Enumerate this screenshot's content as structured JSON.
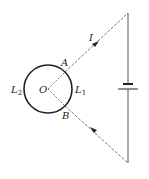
{
  "diagram": {
    "labels": {
      "current": "I",
      "point_a": "A",
      "point_b": "B",
      "center": "O",
      "arc_left": "L",
      "arc_left_sub": "2",
      "arc_right": "L",
      "arc_right_sub": "1"
    },
    "colors": {
      "stroke": "#222222",
      "wire": "#555555",
      "background": "#ffffff"
    },
    "elements": {
      "ring": {
        "cx": 48,
        "cy": 89,
        "r": 24
      },
      "wire_top": {
        "from": [
          48,
          89
        ],
        "to": [
          128,
          13
        ]
      },
      "wire_bottom": {
        "from": [
          48,
          89
        ],
        "to": [
          128,
          163
        ]
      },
      "wire_right": {
        "x": 128,
        "y_top": 13,
        "y_bottom": 163
      },
      "battery": {
        "short_plate_y": 84,
        "long_plate_y": 89
      }
    }
  }
}
